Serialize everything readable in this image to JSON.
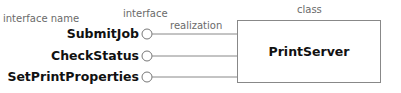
{
  "labels": {
    "interface_name": "interface name",
    "interface": "interface",
    "realization": "realization",
    "class": "class"
  },
  "interfaces": [
    {
      "name": "SubmitJob"
    },
    {
      "name": "CheckStatus"
    },
    {
      "name": "SetPrintProperties"
    }
  ],
  "class_box": {
    "name": "PrintServer"
  },
  "colors": {
    "line": "#888888",
    "text": "#111111",
    "annotation": "#6a6a6a"
  }
}
